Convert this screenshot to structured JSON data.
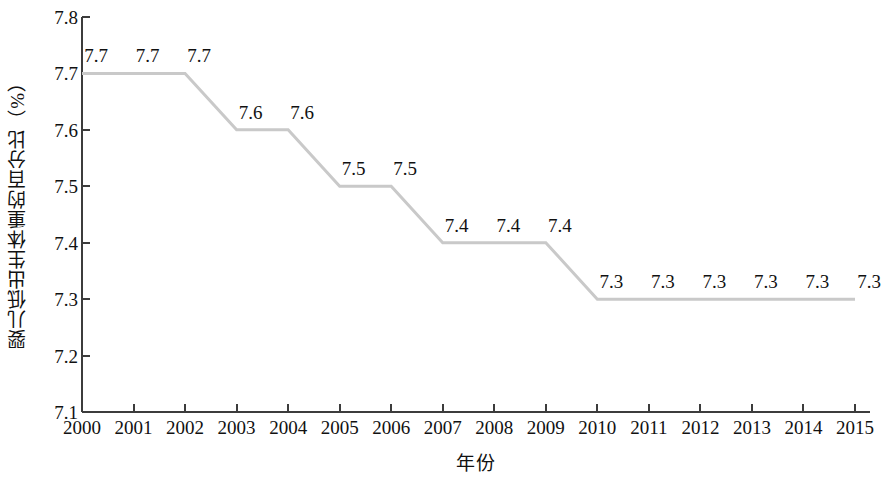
{
  "chart_data": {
    "type": "line",
    "title": "",
    "subtitle": "",
    "xlabel": "年份",
    "ylabel": "婴儿低出生体重的百分比（%）",
    "categories": [
      "2000",
      "2001",
      "2002",
      "2003",
      "2004",
      "2005",
      "2006",
      "2007",
      "2008",
      "2009",
      "2010",
      "2011",
      "2012",
      "2013",
      "2014",
      "2015"
    ],
    "x": [
      2000,
      2001,
      2002,
      2003,
      2004,
      2005,
      2006,
      2007,
      2008,
      2009,
      2010,
      2011,
      2012,
      2013,
      2014,
      2015
    ],
    "values": [
      7.7,
      7.7,
      7.7,
      7.6,
      7.6,
      7.5,
      7.5,
      7.4,
      7.4,
      7.4,
      7.3,
      7.3,
      7.3,
      7.3,
      7.3,
      7.3
    ],
    "point_labels": [
      "7.7",
      "7.7",
      "7.7",
      "7.6",
      "7.6",
      "7.5",
      "7.5",
      "7.4",
      "7.4",
      "7.4",
      "7.3",
      "7.3",
      "7.3",
      "7.3",
      "7.3",
      "7.3"
    ],
    "ylim": [
      7.1,
      7.8
    ],
    "ytick_labels": [
      "7.8",
      "7.7",
      "7.6",
      "7.5",
      "7.4",
      "7.3",
      "7.2",
      "7.1"
    ],
    "ytick_values": [
      7.8,
      7.7,
      7.6,
      7.5,
      7.4,
      7.3,
      7.2,
      7.1
    ],
    "ytick_step": 0.1,
    "xlim": [
      2000,
      2015
    ],
    "grid": false,
    "legend": null,
    "legend_position": "none",
    "series": [
      {
        "name": "婴儿低出生体重的百分比",
        "values": [
          7.7,
          7.7,
          7.7,
          7.6,
          7.6,
          7.5,
          7.5,
          7.4,
          7.4,
          7.4,
          7.3,
          7.3,
          7.3,
          7.3,
          7.3,
          7.3
        ],
        "color": "#c9c9c9"
      }
    ],
    "line_color": "#c9c9c9",
    "line_width": 3,
    "axis_color": "#3c3c3c",
    "background_color": "#ffffff",
    "text_color": "#111111"
  }
}
